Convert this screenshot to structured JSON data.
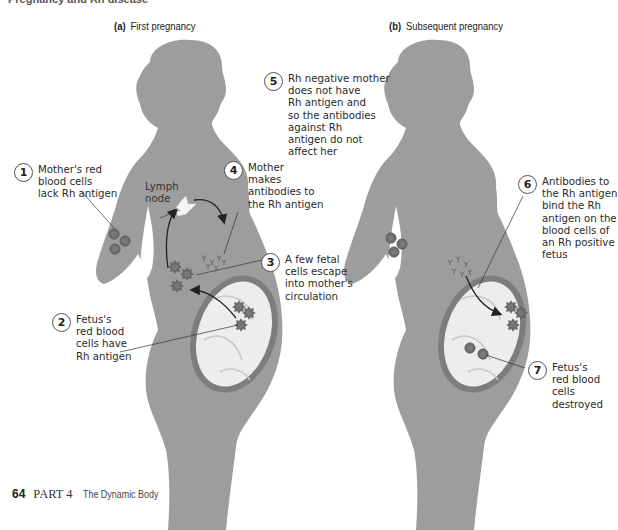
{
  "header": {
    "cut_off_heading": "Pregnancy and Rh disease"
  },
  "panels": [
    {
      "id": "a",
      "letter": "(a)",
      "title": "First pregnancy"
    },
    {
      "id": "b",
      "letter": "(b)",
      "title": "Subsequent pregnancy"
    }
  ],
  "callouts": [
    {
      "number": "1",
      "text": "Mother's red\nblood cells\nlack Rh antigen"
    },
    {
      "number": "2",
      "text": "Fetus's\nred blood\ncells have\nRh antigen"
    },
    {
      "number": "3",
      "text": "A few fetal\ncells escape\ninto mother's\ncirculation"
    },
    {
      "number": "4",
      "text": "Mother\nmakes\nantibodies to\nthe Rh antigen"
    },
    {
      "number": "5",
      "text": "Rh negative mother\ndoes not have\nRh antigen and\nso the antibodies\nagainst Rh\nantigen do not\naffect her"
    },
    {
      "number": "6",
      "text": "Antibodies to\nthe Rh antigen\nbind the Rh\nantigen on the\nblood cells of\nan Rh positive\nfetus"
    },
    {
      "number": "7",
      "text": "Fetus's\nred blood\ncells\ndestroyed"
    }
  ],
  "labels": {
    "lymph_node": "Lymph\nnode"
  },
  "footer": {
    "page_number": "64",
    "part": "PART 4",
    "part_title": "The Dynamic Body"
  },
  "colors": {
    "silhouette": "#9d9d9d",
    "uterus_wall": "#7d7d7d",
    "fetus_fill": "#eeeeee",
    "cell": "#6e6e6e",
    "text": "#2a2a2a"
  }
}
